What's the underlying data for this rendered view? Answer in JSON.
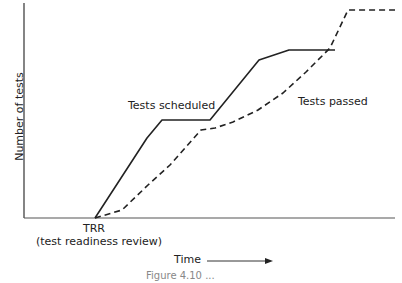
{
  "chart_data": {
    "type": "line",
    "title": "",
    "xlabel": "Time",
    "ylabel": "Number of tests",
    "grid": false,
    "axis_ticks": false,
    "annotations": [
      {
        "text": "TRR",
        "position": "x-axis at curve origin"
      },
      {
        "text": "(test readiness review)",
        "position": "below TRR"
      }
    ],
    "series": [
      {
        "name": "Tests scheduled",
        "style": "solid",
        "points_px": [
          [
            95,
            218
          ],
          [
            147,
            138
          ],
          [
            162,
            120
          ],
          [
            210,
            120
          ],
          [
            259,
            60
          ],
          [
            289,
            50
          ],
          [
            335,
            50
          ]
        ]
      },
      {
        "name": "Tests passed",
        "style": "dashed",
        "points_px": [
          [
            95,
            218
          ],
          [
            122,
            210
          ],
          [
            148,
            185
          ],
          [
            170,
            165
          ],
          [
            201,
            130
          ],
          [
            215,
            128
          ],
          [
            233,
            122
          ],
          [
            258,
            110
          ],
          [
            283,
            93
          ],
          [
            306,
            72
          ],
          [
            330,
            48
          ],
          [
            348,
            10
          ],
          [
            395,
            10
          ]
        ]
      }
    ],
    "xlim_px": [
      24,
      395
    ],
    "ylim_px": [
      218,
      3
    ]
  },
  "labels": {
    "ylabel": "Number of tests",
    "scheduled": "Tests scheduled",
    "passed": "Tests passed",
    "trr": "TRR",
    "trr_full": "(test readiness review)",
    "time": "Time",
    "caption": "Figure 4.10 ..."
  }
}
